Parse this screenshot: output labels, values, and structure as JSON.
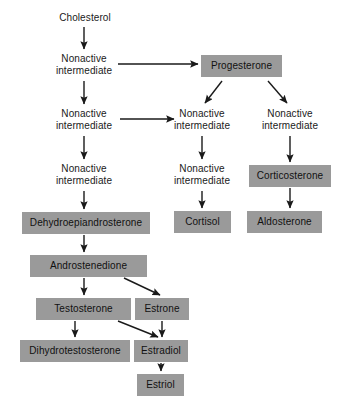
{
  "diagram": {
    "colors": {
      "box_fill": "#9a9a9a",
      "text": "#1a1a1a",
      "arrow": "#1a1a1a",
      "background": "#ffffff"
    },
    "plain_nodes": [
      {
        "id": "cholesterol",
        "label": "Cholesterol",
        "x": 47,
        "y": 12,
        "w": 76
      },
      {
        "id": "nonactive-left-1",
        "label": "Nonactive\nintermediate",
        "x": 42,
        "y": 53,
        "w": 84
      },
      {
        "id": "nonactive-left-2",
        "label": "Nonactive\nintermediate",
        "x": 42,
        "y": 108,
        "w": 84
      },
      {
        "id": "nonactive-left-3",
        "label": "Nonactive\nintermediate",
        "x": 42,
        "y": 163,
        "w": 84
      },
      {
        "id": "nonactive-mid-1",
        "label": "Nonactive\nintermediate",
        "x": 160,
        "y": 108,
        "w": 84
      },
      {
        "id": "nonactive-mid-2",
        "label": "Nonactive\nintermediate",
        "x": 160,
        "y": 163,
        "w": 84
      },
      {
        "id": "nonactive-right-1",
        "label": "Nonactive\nintermediate",
        "x": 248,
        "y": 108,
        "w": 84
      }
    ],
    "box_nodes": [
      {
        "id": "progesterone",
        "label": "Progesterone",
        "x": 201,
        "y": 55,
        "w": 81
      },
      {
        "id": "corticosterone",
        "label": "Corticosterone",
        "x": 249,
        "y": 165,
        "w": 82
      },
      {
        "id": "cortisol",
        "label": "Cortisol",
        "x": 174,
        "y": 211,
        "w": 57
      },
      {
        "id": "aldosterone",
        "label": "Aldosterone",
        "x": 247,
        "y": 211,
        "w": 75
      },
      {
        "id": "dehydroepiandrosterone",
        "label": "Dehydroepiandrosterone",
        "x": 22,
        "y": 212,
        "w": 128
      },
      {
        "id": "androstenedione",
        "label": "Androstenedione",
        "x": 30,
        "y": 255,
        "w": 117
      },
      {
        "id": "testosterone",
        "label": "Testosterone",
        "x": 36,
        "y": 298,
        "w": 95
      },
      {
        "id": "estrone",
        "label": "Estrone",
        "x": 135,
        "y": 298,
        "w": 54
      },
      {
        "id": "dihydrotestosterone",
        "label": "Dihydrotestosterone",
        "x": 20,
        "y": 340,
        "w": 110
      },
      {
        "id": "estradiol",
        "label": "Estradiol",
        "x": 134,
        "y": 340,
        "w": 54
      },
      {
        "id": "estriol",
        "label": "Estriol",
        "x": 137,
        "y": 374,
        "w": 47
      }
    ],
    "arrows": [
      {
        "id": "cholesterol-to-nonactive1",
        "from": "cholesterol",
        "to": "nonactive-left-1",
        "x1": 84,
        "y1": 27,
        "x2": 84,
        "y2": 49
      },
      {
        "id": "nonactive1-to-nonactive2",
        "from": "nonactive-left-1",
        "to": "nonactive-left-2",
        "x1": 84,
        "y1": 81,
        "x2": 84,
        "y2": 104
      },
      {
        "id": "nonactive1-to-progesterone",
        "from": "nonactive-left-1",
        "to": "progesterone",
        "x1": 118,
        "y1": 64,
        "x2": 198,
        "y2": 64
      },
      {
        "id": "nonactive2-to-nonactive3",
        "from": "nonactive-left-2",
        "to": "nonactive-left-3",
        "x1": 84,
        "y1": 136,
        "x2": 84,
        "y2": 159
      },
      {
        "id": "nonactive2-to-mid1",
        "from": "nonactive-left-2",
        "to": "nonactive-mid-1",
        "x1": 120,
        "y1": 119,
        "x2": 174,
        "y2": 119
      },
      {
        "id": "progesterone-to-mid1",
        "from": "progesterone",
        "to": "nonactive-mid-1",
        "x1": 222,
        "y1": 81,
        "x2": 205,
        "y2": 103
      },
      {
        "id": "progesterone-to-right1",
        "from": "progesterone",
        "to": "nonactive-right-1",
        "x1": 268,
        "y1": 81,
        "x2": 287,
        "y2": 103
      },
      {
        "id": "nonactive3-to-dhea",
        "from": "nonactive-left-3",
        "to": "dehydroepiandrosterone",
        "x1": 84,
        "y1": 191,
        "x2": 84,
        "y2": 209
      },
      {
        "id": "mid1-to-mid2",
        "from": "nonactive-mid-1",
        "to": "nonactive-mid-2",
        "x1": 202,
        "y1": 136,
        "x2": 202,
        "y2": 159
      },
      {
        "id": "mid2-to-cortisol",
        "from": "nonactive-mid-2",
        "to": "cortisol",
        "x1": 202,
        "y1": 191,
        "x2": 202,
        "y2": 208
      },
      {
        "id": "right1-to-corticosterone",
        "from": "nonactive-right-1",
        "to": "corticosterone",
        "x1": 290,
        "y1": 136,
        "x2": 290,
        "y2": 162
      },
      {
        "id": "corticosterone-to-aldosterone",
        "from": "corticosterone",
        "to": "aldosterone",
        "x1": 290,
        "y1": 188,
        "x2": 290,
        "y2": 208
      },
      {
        "id": "dhea-to-androstenedione",
        "from": "dehydroepiandrosterone",
        "to": "androstenedione",
        "x1": 84,
        "y1": 235,
        "x2": 84,
        "y2": 252
      },
      {
        "id": "androstenedione-to-testosterone",
        "from": "androstenedione",
        "to": "testosterone",
        "x1": 84,
        "y1": 278,
        "x2": 84,
        "y2": 295
      },
      {
        "id": "androstenedione-to-estrone",
        "from": "androstenedione",
        "to": "estrone",
        "x1": 124,
        "y1": 278,
        "x2": 160,
        "y2": 295
      },
      {
        "id": "testosterone-to-dihydrotestosterone",
        "from": "testosterone",
        "to": "dihydrotestosterone",
        "x1": 75,
        "y1": 321,
        "x2": 75,
        "y2": 337
      },
      {
        "id": "testosterone-to-estradiol",
        "from": "testosterone",
        "to": "estradiol",
        "x1": 118,
        "y1": 321,
        "x2": 158,
        "y2": 337
      },
      {
        "id": "estrone-to-estradiol",
        "from": "estrone",
        "to": "estradiol",
        "x1": 162,
        "y1": 321,
        "x2": 162,
        "y2": 337
      },
      {
        "id": "estradiol-to-estriol",
        "from": "estradiol",
        "to": "estriol",
        "x1": 161,
        "y1": 363,
        "x2": 161,
        "y2": 371
      }
    ]
  }
}
